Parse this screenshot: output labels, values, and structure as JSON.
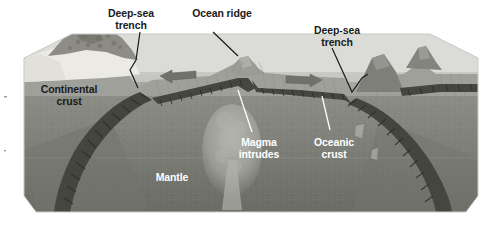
{
  "diagram": {
    "type": "geological-cross-section",
    "background_color": "#ffffff"
  },
  "labels": {
    "trench_left": {
      "text": "Deep-sea\ntrench",
      "style": "dark",
      "x": 100,
      "y": 8
    },
    "ocean_ridge": {
      "text": "Ocean ridge",
      "style": "dark",
      "x": 183,
      "y": 8
    },
    "trench_right": {
      "text": "Deep-sea\ntrench",
      "style": "dark",
      "x": 306,
      "y": 25
    },
    "continental_crust": {
      "text": "Continental\ncrust",
      "style": "dark",
      "x": 32,
      "y": 84
    },
    "mantle": {
      "text": "Mantle",
      "style": "light",
      "x": 145,
      "y": 172
    },
    "magma_intrudes": {
      "text": "Magma\nintrudes",
      "style": "light",
      "x": 259,
      "y": 137
    },
    "oceanic_crust": {
      "text": "Oceanic\ncrust",
      "style": "light",
      "x": 318,
      "y": 137
    }
  },
  "colors": {
    "water_far": "#d8d9d6",
    "water_near": "#b9bab6",
    "sea_floor": "#a9aaa5",
    "continent": "#e7e6e1",
    "mountain": "#8f8e88",
    "mantle_upper": "#8a8b85",
    "mantle_lower": "#6f7069",
    "crust_band": "#4a4b45",
    "magma": "#a5a69f",
    "leader_dark": "#1a1a1a",
    "leader_light": "#ffffff",
    "arrow": "#70716b"
  },
  "features": {
    "arrow_left": {
      "name": "spreading-arrow-left",
      "direction": "left"
    },
    "arrow_right": {
      "name": "spreading-arrow-right",
      "direction": "right"
    },
    "ridge_peak": {
      "name": "ocean-ridge-peak"
    },
    "volcano_inner": {
      "name": "volcanic-cone-inner"
    },
    "volcano_outer": {
      "name": "volcanic-island-outer"
    },
    "slab_left": {
      "name": "subducting-slab-left"
    },
    "slab_right": {
      "name": "subducting-slab-right"
    },
    "magma_plume": {
      "name": "magma-plume"
    }
  }
}
